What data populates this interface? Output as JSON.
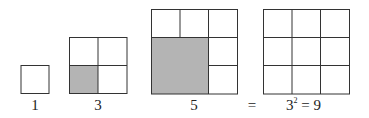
{
  "diagram": {
    "colors": {
      "line": "#333333",
      "shade": "#b4b4b4"
    },
    "figures": [
      {
        "id": "one",
        "label": "1",
        "grid": 1,
        "shaded_cells": 0
      },
      {
        "id": "three",
        "label": "3",
        "grid": 2,
        "shaded_cells": 1
      },
      {
        "id": "five",
        "label": "5",
        "grid": 3,
        "shaded_cells": 4
      },
      {
        "id": "result",
        "label_base": "3",
        "label_exp": "2",
        "label_rest": " = 9",
        "grid": 3,
        "shaded_cells": 0
      }
    ],
    "equals": "="
  }
}
